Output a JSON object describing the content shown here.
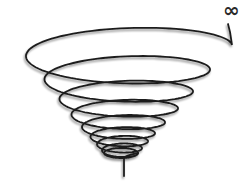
{
  "diagram": {
    "type": "conical-spiral",
    "label": "∞",
    "colors": {
      "stroke": "#1e1e1e",
      "shadow": "#8a8a8a",
      "background": "#ffffff"
    },
    "loops": [
      {
        "cx": 124,
        "cy": 45,
        "rx": 108,
        "ry": 24
      },
      {
        "cx": 123,
        "cy": 69,
        "rx": 87,
        "ry": 19
      },
      {
        "cx": 123,
        "cy": 91,
        "rx": 70,
        "ry": 15
      },
      {
        "cx": 122,
        "cy": 108,
        "rx": 56,
        "ry": 12
      },
      {
        "cx": 121,
        "cy": 122,
        "rx": 44,
        "ry": 10
      },
      {
        "cx": 121,
        "cy": 133,
        "rx": 34,
        "ry": 8
      },
      {
        "cx": 121,
        "cy": 141,
        "rx": 27,
        "ry": 7
      },
      {
        "cx": 121,
        "cy": 148,
        "rx": 21,
        "ry": 6
      },
      {
        "cx": 121,
        "cy": 153,
        "rx": 17,
        "ry": 5
      }
    ],
    "stem": {
      "x": 124,
      "y1": 158,
      "y2": 176
    }
  }
}
